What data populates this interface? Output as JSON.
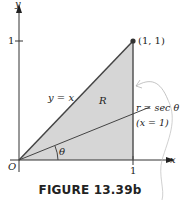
{
  "figure": {
    "caption": "FIGURE 13.39b",
    "axes": {
      "x_label": "x",
      "y_label": "y",
      "origin_label": "O",
      "x_tick_label": "1",
      "y_tick_label": "1"
    },
    "labels": {
      "point": "(1, 1)",
      "line_y_eq_x": "y = x",
      "region": "R",
      "polar_line": "r = sec θ",
      "polar_line_cartesian": "(x = 1)",
      "angle": "θ"
    },
    "colors": {
      "region_fill": "#d6d6d6",
      "line": "#333333",
      "point": "#333333"
    }
  }
}
